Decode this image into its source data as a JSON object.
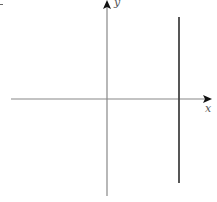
{
  "diagram": {
    "type": "coordinate-plane",
    "axes": {
      "x_label": "x",
      "y_label": "y",
      "color": "#888888"
    },
    "vertical_line": {
      "side": "positive-x",
      "color": "#444444"
    }
  }
}
